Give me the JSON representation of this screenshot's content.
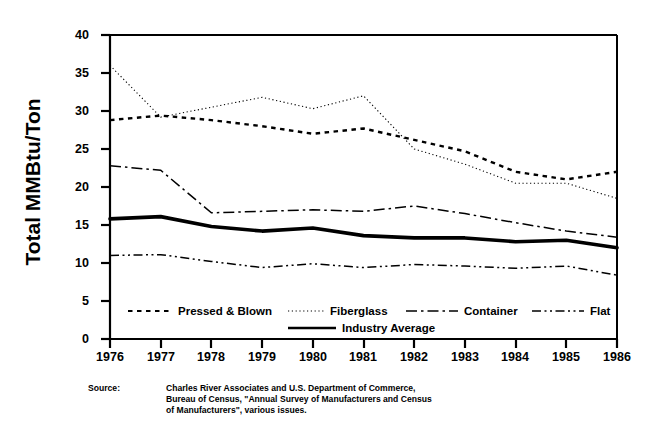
{
  "chart_data": {
    "type": "line",
    "title": "",
    "xlabel": "",
    "ylabel": "Total MMBtu/Ton",
    "x": [
      1976,
      1977,
      1978,
      1979,
      1980,
      1981,
      1982,
      1983,
      1984,
      1985,
      1986
    ],
    "xtick_labels": [
      "1976",
      "1977",
      "1978",
      "1979",
      "1980",
      "1981",
      "1982",
      "1983",
      "1984",
      "1985",
      "1986"
    ],
    "ytick_labels": [
      "0",
      "5",
      "10",
      "15",
      "20",
      "25",
      "30",
      "35",
      "40"
    ],
    "ytick_values": [
      0,
      5,
      10,
      15,
      20,
      25,
      30,
      35,
      40
    ],
    "xlim": [
      1976,
      1986
    ],
    "ylim": [
      0,
      40
    ],
    "grid": false,
    "legend_position": "inside-bottom",
    "series": [
      {
        "name": "Pressed & Blown",
        "style": "dashed",
        "color": "#000000",
        "values": [
          28.8,
          29.4,
          28.8,
          28.0,
          27.0,
          27.7,
          26.2,
          24.7,
          22.0,
          21.0,
          22.0
        ]
      },
      {
        "name": "Fiberglass",
        "style": "dotted",
        "color": "#000000",
        "values": [
          36.0,
          29.2,
          30.5,
          31.8,
          30.3,
          32.0,
          25.0,
          23.0,
          20.5,
          20.5,
          18.5
        ]
      },
      {
        "name": "Container",
        "style": "dash-dot",
        "color": "#000000",
        "values": [
          22.8,
          22.2,
          16.6,
          16.8,
          17.0,
          16.8,
          17.5,
          16.5,
          15.3,
          14.2,
          13.4
        ]
      },
      {
        "name": "Flat",
        "style": "dash-dot-dot",
        "color": "#000000",
        "values": [
          11.0,
          11.1,
          10.2,
          9.4,
          9.9,
          9.4,
          9.8,
          9.6,
          9.3,
          9.6,
          8.4
        ]
      },
      {
        "name": "Industry Average",
        "style": "solid-thick",
        "color": "#000000",
        "values": [
          15.8,
          16.1,
          14.8,
          14.2,
          14.6,
          13.6,
          13.3,
          13.3,
          12.8,
          13.0,
          12.0
        ]
      }
    ]
  },
  "axis": {
    "ylabel": "Total MMBtu/Ton"
  },
  "legend": {
    "items": [
      {
        "label": "Pressed & Blown"
      },
      {
        "label": "Fiberglass"
      },
      {
        "label": "Container"
      },
      {
        "label": "Flat"
      },
      {
        "label": "Industry Average"
      }
    ]
  },
  "source": {
    "label": "Source:",
    "text": "Charles River Associates and U.S. Department of Commerce,\nBureau of Census, \"Annual Survey of Manufacturers and Census\nof Manufacturers\", various issues."
  }
}
